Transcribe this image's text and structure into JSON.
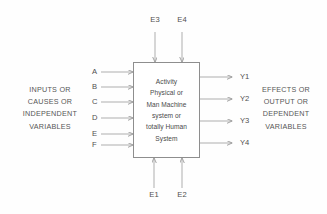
{
  "diagram": {
    "background_color": "#fefefe",
    "line_color": "#8e8e8e",
    "text_color": "#4f4f4f"
  },
  "process_box": {
    "lines": [
      "Activity",
      "Physical or",
      "Man Machine",
      "system or",
      "totally Human",
      "System"
    ]
  },
  "left_label": {
    "lines": [
      "INPUTS OR",
      "CAUSES OR",
      "INDEPENDENT",
      "VARIABLES"
    ]
  },
  "right_label": {
    "lines": [
      "EFFECTS OR",
      "OUTPUT OR",
      "DEPENDENT",
      "VARIABLES"
    ]
  },
  "inputs": [
    {
      "label": "A"
    },
    {
      "label": "B"
    },
    {
      "label": "C"
    },
    {
      "label": "D"
    },
    {
      "label": "E"
    },
    {
      "label": "F"
    }
  ],
  "outputs": [
    {
      "label": "Y1"
    },
    {
      "label": "Y2"
    },
    {
      "label": "Y3"
    },
    {
      "label": "Y4"
    }
  ],
  "environment_top": [
    {
      "label": "E3"
    },
    {
      "label": "E4"
    }
  ],
  "environment_bottom": [
    {
      "label": "E1"
    },
    {
      "label": "E2"
    }
  ]
}
